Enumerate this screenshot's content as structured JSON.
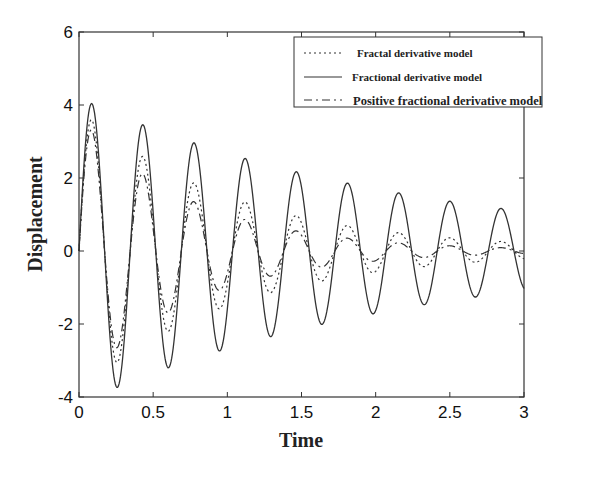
{
  "chart_data": {
    "type": "line",
    "title": "",
    "xlabel": "Time",
    "ylabel": "Displacement",
    "xlim": [
      0,
      3
    ],
    "ylim": [
      -4,
      6
    ],
    "xticks": [
      "0",
      "0.5",
      "1",
      "1.5",
      "2",
      "2.5",
      "3"
    ],
    "yticks": [
      "-4",
      "-2",
      "0",
      "2",
      "4",
      "6"
    ],
    "grid": false,
    "legend_position": "upper right",
    "series": [
      {
        "name": "Fractal derivative model",
        "style": "dotted",
        "peaks_x": [
          0.12,
          0.47,
          0.82,
          1.17,
          1.51,
          1.86,
          2.2,
          2.55,
          2.89
        ],
        "peaks_y": [
          3.8,
          3.0,
          2.0,
          1.35,
          0.95,
          0.65,
          0.45,
          0.3,
          0.2
        ],
        "troughs_x": [
          0.3,
          0.65,
          0.99,
          1.34,
          1.68,
          2.03,
          2.37,
          2.72
        ],
        "troughs_y": [
          -3.5,
          -2.5,
          -1.6,
          -1.1,
          -0.75,
          -0.5,
          -0.35,
          -0.2
        ],
        "amplitude": 3.9,
        "decay": 0.95,
        "period": 0.345,
        "phase": 0.0
      },
      {
        "name": "Fractional derivative model",
        "style": "solid",
        "peaks_x": [
          0.12,
          0.47,
          0.82,
          1.17,
          1.51,
          1.86,
          2.2,
          2.55,
          2.89
        ],
        "peaks_y": [
          4.05,
          3.4,
          2.85,
          2.4,
          2.05,
          1.75,
          1.5,
          1.25,
          1.1
        ],
        "troughs_x": [
          0.3,
          0.65,
          0.99,
          1.34,
          1.68,
          2.03,
          2.37,
          2.72
        ],
        "troughs_y": [
          -3.7,
          -3.1,
          -2.6,
          -2.2,
          -1.85,
          -1.55,
          -1.3,
          -1.05
        ],
        "amplitude": 4.2,
        "decay": 0.45,
        "period": 0.345,
        "phase": 0.0
      },
      {
        "name": "Positive fractional derivative model",
        "style": "dashdot",
        "peaks_x": [
          0.12,
          0.47,
          0.82,
          1.17,
          1.51,
          1.86,
          2.2,
          2.55,
          2.89
        ],
        "peaks_y": [
          3.6,
          2.0,
          1.1,
          0.7,
          0.45,
          0.25,
          0.2,
          0.15,
          0.1
        ],
        "troughs_x": [
          0.3,
          0.65,
          0.99,
          1.34,
          1.68,
          2.03,
          2.37,
          2.72
        ],
        "troughs_y": [
          -2.7,
          -1.5,
          -0.9,
          -0.55,
          -0.3,
          -0.2,
          -0.15,
          -0.1
        ],
        "amplitude": 3.7,
        "decay": 1.3,
        "period": 0.345,
        "phase": 0.0
      }
    ]
  },
  "legend": {
    "items": [
      "Fractal derivative model",
      "Fractional derivative model",
      "Positive fractional derivative model"
    ]
  }
}
